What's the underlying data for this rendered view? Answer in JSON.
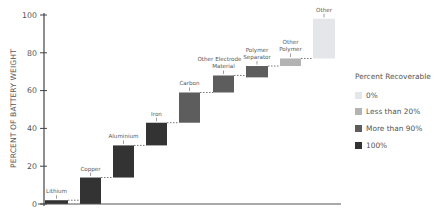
{
  "chart_data": {
    "type": "bar",
    "subtype": "waterfall",
    "title": "",
    "xlabel": "",
    "ylabel": "PERCENT OF BATTERY WEIGHT",
    "ylim": [
      0,
      100
    ],
    "yticks": [
      0,
      20,
      40,
      60,
      80,
      100
    ],
    "grid": false,
    "legend_position": "right",
    "categories": [
      "Lithium",
      "Copper",
      "Aluminium",
      "Iron",
      "Carbon",
      "Other Electrode Material",
      "Polymer Separator",
      "Other Polymer",
      "Other"
    ],
    "bars": [
      {
        "label": "Lithium",
        "start": 0,
        "end": 2,
        "value": 2,
        "recoverable": "100%"
      },
      {
        "label": "Copper",
        "start": 0,
        "end": 14,
        "value": 14,
        "recoverable": "100%"
      },
      {
        "label": "Aluminium",
        "start": 14,
        "end": 31,
        "value": 17,
        "recoverable": "100%"
      },
      {
        "label": "Iron",
        "start": 31,
        "end": 43,
        "value": 12,
        "recoverable": "100%"
      },
      {
        "label": "Carbon",
        "start": 43,
        "end": 59,
        "value": 16,
        "recoverable": "More than 90%"
      },
      {
        "label": "Other Electrode Material",
        "start": 59,
        "end": 68,
        "value": 9,
        "recoverable": "More than 90%"
      },
      {
        "label": "Polymer Separator",
        "start": 67,
        "end": 73,
        "value": 6,
        "recoverable": "More than 90%"
      },
      {
        "label": "Other Polymer",
        "start": 73,
        "end": 77,
        "value": 4,
        "recoverable": "Less than 20%"
      },
      {
        "label": "Other",
        "start": 77,
        "end": 98,
        "value": 21,
        "recoverable": "0%"
      }
    ],
    "legend": {
      "title": "Percent Recoverable",
      "entries": [
        {
          "label": "0%",
          "color": "#e4e6ea"
        },
        {
          "label": "Less than 20%",
          "color": "#b3b3b3"
        },
        {
          "label": "More than 90%",
          "color": "#5d5d5d"
        },
        {
          "label": "100%",
          "color": "#333333"
        }
      ]
    }
  },
  "axis": {
    "ylabel": "PERCENT OF BATTERY WEIGHT",
    "ticks": [
      "0",
      "20",
      "40",
      "60",
      "80",
      "100"
    ]
  },
  "legend": {
    "title": "Percent Recoverable",
    "items": [
      {
        "label": "0%",
        "color": "#e4e6ea"
      },
      {
        "label": "Less than 20%",
        "color": "#b3b3b3"
      },
      {
        "label": "More than 90%",
        "color": "#5d5d5d"
      },
      {
        "label": "100%",
        "color": "#333333"
      }
    ]
  }
}
